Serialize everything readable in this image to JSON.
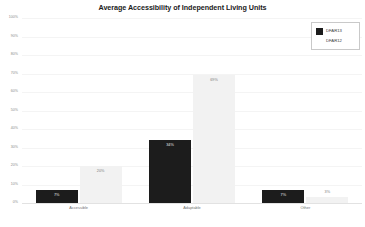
{
  "chart_data": {
    "type": "bar",
    "title": "Average Accessibility of Independent Living Units",
    "xlabel": "",
    "ylabel": "",
    "ylim": [
      0,
      100
    ],
    "grid": true,
    "legend_position": "top-right",
    "categories": [
      "Accessible",
      "Adaptable",
      "Other"
    ],
    "ytick_labels": [
      "100%",
      "90%",
      "80%",
      "70%",
      "60%",
      "50%",
      "40%",
      "30%",
      "20%",
      "10%",
      "0%"
    ],
    "ytick_values": [
      100,
      90,
      80,
      70,
      60,
      50,
      40,
      30,
      20,
      10,
      0
    ],
    "series": [
      {
        "name": "DFAR13",
        "color": "#1c1c1c",
        "values": [
          7,
          34,
          7
        ],
        "value_labels": [
          "7%",
          "34%",
          "7%"
        ]
      },
      {
        "name": "DFAR12",
        "color": "#f2f2f2",
        "values": [
          20,
          69,
          3
        ],
        "value_labels": [
          "20%",
          "69%",
          "3%"
        ]
      }
    ]
  },
  "legend": {
    "entries": [
      {
        "label": "DFAR13",
        "swatch": "dark"
      },
      {
        "label": "DFAR12",
        "swatch": "light"
      }
    ]
  }
}
